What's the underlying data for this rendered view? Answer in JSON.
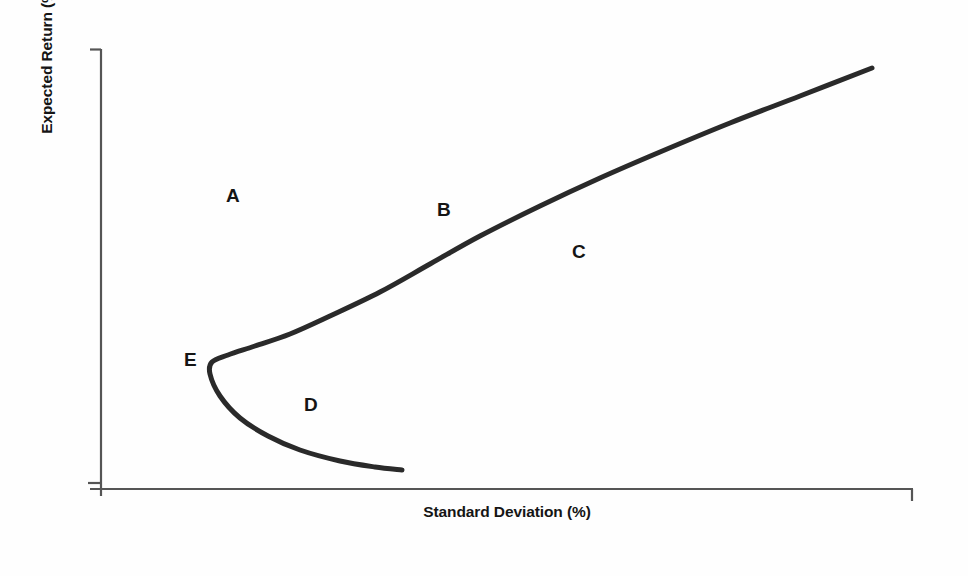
{
  "figure": {
    "background_color": "#fefefe",
    "frame_color": "#4a4a4a",
    "ink_color": "#2a2a2a"
  },
  "axes": {
    "y_title": "Expected Return (%)",
    "x_title": "Standard Deviation (%)",
    "axis_color": "#555555",
    "show_tick_labels": false
  },
  "labels": {
    "a": "A",
    "b": "B",
    "c": "C",
    "d": "D",
    "e": "E"
  },
  "chart_data": {
    "type": "line",
    "title": "",
    "subtitle": "",
    "xlabel": "Standard Deviation (%)",
    "ylabel": "Expected Return (%)",
    "xlim": [
      0,
      100
    ],
    "ylim": [
      0,
      100
    ],
    "grid": false,
    "legend_position": "none",
    "axis_tick_labels": {
      "x": [],
      "y": []
    },
    "series": [
      {
        "name": "Investment opportunity set (efficient frontier hyperbola)",
        "color": "#2a2a2a",
        "line_width": 5,
        "description": "Sideways parabola opening to the right; upper branch is the efficient frontier, lower branch is inefficient, vertex is the global minimum-variance portfolio",
        "points_px": [
          [
            872,
            68
          ],
          [
            800,
            96
          ],
          [
            730,
            123
          ],
          [
            660,
            152
          ],
          [
            600,
            178
          ],
          [
            540,
            206
          ],
          [
            480,
            236
          ],
          [
            430,
            264
          ],
          [
            380,
            292
          ],
          [
            330,
            316
          ],
          [
            290,
            334
          ],
          [
            255,
            346
          ],
          [
            228,
            355
          ],
          [
            212,
            362
          ],
          [
            210,
            374
          ],
          [
            220,
            396
          ],
          [
            240,
            418
          ],
          [
            268,
            436
          ],
          [
            300,
            450
          ],
          [
            340,
            461
          ],
          [
            375,
            467
          ],
          [
            402,
            470
          ]
        ],
        "vertex_px": [
          212,
          362
        ],
        "upper_endpoint_px": [
          872,
          68
        ],
        "lower_endpoint_px": [
          402,
          470
        ]
      }
    ],
    "annotations": [
      {
        "text": "A",
        "x_px": 232,
        "y_px": 196,
        "note": "region above and left of the frontier — unattainable portfolios"
      },
      {
        "text": "B",
        "x_px": 443,
        "y_px": 210,
        "note": "point on the efficient frontier (upper branch)"
      },
      {
        "text": "C",
        "x_px": 578,
        "y_px": 252,
        "note": "region below and right of the frontier — attainable but inefficient"
      },
      {
        "text": "D",
        "x_px": 310,
        "y_px": 405,
        "note": "point on the lower, inefficient branch of the opportunity set"
      },
      {
        "text": "E",
        "x_px": 190,
        "y_px": 360,
        "note": "global minimum variance portfolio at the vertex"
      }
    ]
  }
}
